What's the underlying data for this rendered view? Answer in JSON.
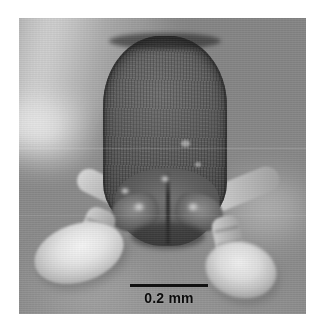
{
  "figure": {
    "kind": "light-micrograph",
    "orientation": "full-face view",
    "color_mode": "grayscale",
    "background_color": "#8b8b8b",
    "border_color": "#ffffff"
  },
  "scalebar": {
    "label": "0.2 mm",
    "value": "0.2",
    "unit": "mm",
    "bar_color": "#141414",
    "text_color": "#0d0d0d",
    "position": "bottom-center"
  },
  "specimen_parts": {
    "head_capsule": "head-capsule",
    "vertex": "vertex-margin",
    "clypeus": "clypeus",
    "mandible_left": "left-mandible",
    "mandible_right": "right-mandible",
    "labrum": "labrum",
    "scape_left": "left-antennal-scape",
    "scape_right": "right-antennal-scape",
    "funiculus_left": "left-antennal-funiculus",
    "funiculus_right": "right-antennal-funiculus",
    "club_left": "left-antennal-club",
    "club_right": "right-antennal-club"
  }
}
